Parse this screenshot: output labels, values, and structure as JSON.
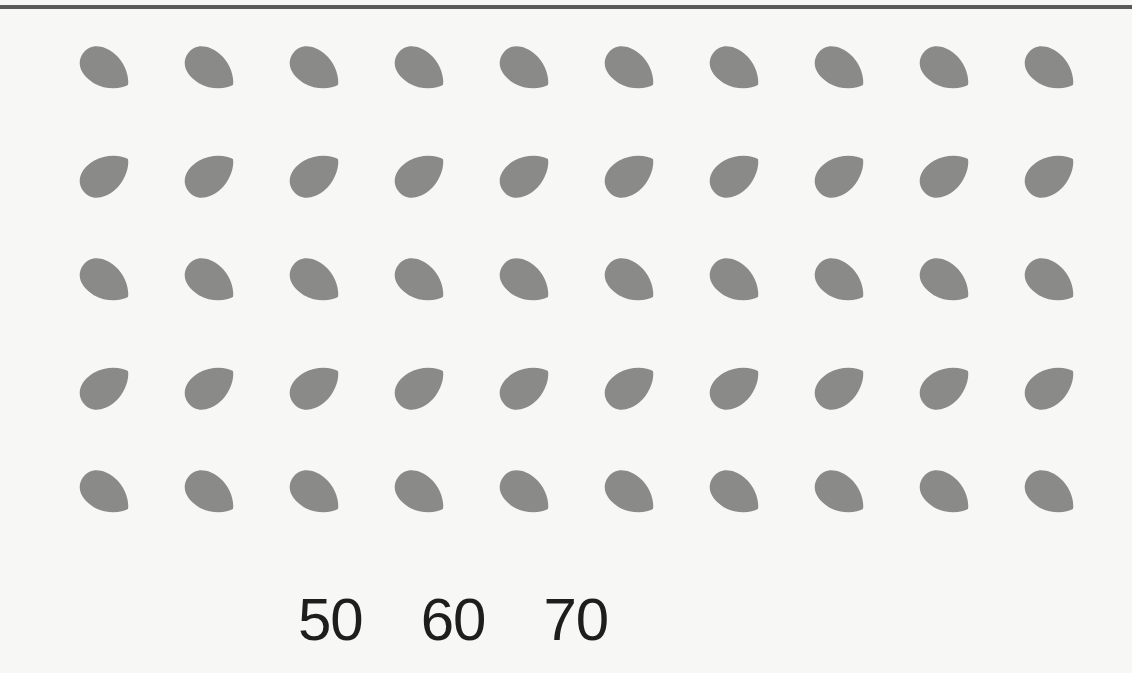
{
  "worksheet": {
    "rows": 5,
    "columns": 10,
    "item": "almond",
    "item_icon": "almond-icon",
    "item_color": "#8a8a88",
    "row_orientations": [
      "down-right",
      "up-right",
      "down-right",
      "up-right",
      "down-right"
    ],
    "total_count": 50
  },
  "choices": [
    "50",
    "60",
    "70"
  ]
}
